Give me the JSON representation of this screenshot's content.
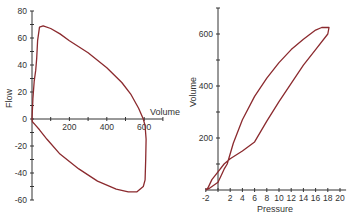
{
  "chart_data": [
    {
      "type": "line",
      "title": "",
      "xlabel": "Volume",
      "ylabel": "Flow",
      "xlim": [
        0,
        700
      ],
      "ylim": [
        -60,
        80
      ],
      "x_ticks": [
        0,
        100,
        200,
        300,
        400,
        500,
        600,
        700
      ],
      "x_tick_labels": [
        "200",
        "400",
        "600"
      ],
      "y_ticks": [
        -60,
        -50,
        -40,
        -30,
        -20,
        -10,
        0,
        10,
        20,
        30,
        40,
        50,
        60,
        70,
        80
      ],
      "y_tick_labels": [
        "80",
        "60",
        "40",
        "20",
        "0",
        "-20",
        "-40",
        "-60"
      ],
      "grid": false,
      "color": "#8b2a2e",
      "series": [
        {
          "name": "Flow-Volume loop",
          "points": [
            [
              0,
              0
            ],
            [
              5,
              15
            ],
            [
              12,
              28
            ],
            [
              20,
              36
            ],
            [
              25,
              45
            ],
            [
              30,
              58
            ],
            [
              40,
              68
            ],
            [
              60,
              69
            ],
            [
              100,
              67
            ],
            [
              150,
              63
            ],
            [
              200,
              58
            ],
            [
              300,
              49
            ],
            [
              400,
              38
            ],
            [
              480,
              27
            ],
            [
              530,
              18
            ],
            [
              570,
              8
            ],
            [
              595,
              0
            ],
            [
              605,
              -5
            ],
            [
              610,
              -15
            ],
            [
              608,
              -30
            ],
            [
              605,
              -45
            ],
            [
              595,
              -50
            ],
            [
              560,
              -54
            ],
            [
              515,
              -54
            ],
            [
              450,
              -52
            ],
            [
              350,
              -46
            ],
            [
              250,
              -37
            ],
            [
              150,
              -26
            ],
            [
              80,
              -15
            ],
            [
              40,
              -8
            ],
            [
              15,
              -4
            ],
            [
              2,
              -2
            ],
            [
              0,
              0
            ]
          ]
        }
      ]
    },
    {
      "type": "line",
      "title": "",
      "xlabel": "Pressure",
      "ylabel": "Volume",
      "xlim": [
        -2,
        21
      ],
      "ylim": [
        0,
        700
      ],
      "x_ticks": [
        -2,
        0,
        2,
        4,
        6,
        8,
        10,
        12,
        14,
        16,
        18,
        20
      ],
      "x_tick_labels": [
        "-2",
        "2",
        "4",
        "6",
        "8",
        "10",
        "12",
        "14",
        "16",
        "18",
        "20"
      ],
      "y_ticks": [
        0,
        100,
        200,
        300,
        400,
        500,
        600,
        700
      ],
      "y_tick_labels": [
        "200",
        "400",
        "600"
      ],
      "grid": false,
      "color": "#8b2a2e",
      "series": [
        {
          "name": "Pressure-Volume loop",
          "points": [
            [
              -2,
              0
            ],
            [
              -1.5,
              5
            ],
            [
              0,
              30
            ],
            [
              0.5,
              55
            ],
            [
              1,
              80
            ],
            [
              1.5,
              100
            ],
            [
              2.5,
              180
            ],
            [
              4,
              270
            ],
            [
              6,
              360
            ],
            [
              8,
              430
            ],
            [
              10,
              490
            ],
            [
              12,
              540
            ],
            [
              14,
              580
            ],
            [
              16,
              615
            ],
            [
              17,
              625
            ],
            [
              18.2,
              625
            ],
            [
              18,
              600
            ],
            [
              16,
              540
            ],
            [
              14,
              480
            ],
            [
              12,
              410
            ],
            [
              10,
              340
            ],
            [
              8,
              265
            ],
            [
              6,
              185
            ],
            [
              4,
              150
            ],
            [
              2,
              120
            ],
            [
              1,
              100
            ],
            [
              0,
              70
            ],
            [
              -1,
              40
            ],
            [
              -1.6,
              10
            ],
            [
              -2,
              0
            ]
          ]
        }
      ]
    }
  ],
  "labels": {
    "left_xlabel": "Volume",
    "left_ylabel": "Flow",
    "right_xlabel": "Pressure",
    "right_ylabel": "Volume"
  }
}
